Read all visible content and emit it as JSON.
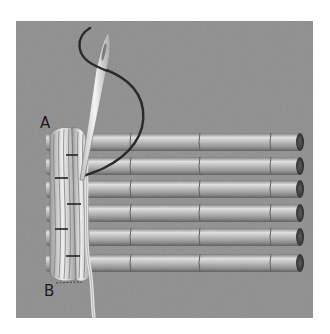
{
  "figure": {
    "labels": {
      "start": "A",
      "end": "B"
    },
    "rods": {
      "count": 6,
      "segments_per_rod": 4
    },
    "colors": {
      "background": "#8c8c8c",
      "rod_light": "#d8d8d8",
      "rod_dark": "#6a6a6a",
      "rod_end": "#3a3a3a",
      "wrap_fiber": "#e6e6e6",
      "thread": "#2a2a2a",
      "needle": "#ececec"
    }
  }
}
